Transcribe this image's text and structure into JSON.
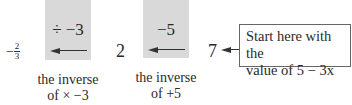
{
  "diagram": {
    "steps": [
      {
        "operation": "÷ −3",
        "inverse_label_line1": "the inverse",
        "inverse_label_line2": "of × −3"
      },
      {
        "operation": "−5",
        "inverse_label_line1": "the inverse",
        "inverse_label_line2": "of +5"
      }
    ],
    "values": {
      "result_sign": "−",
      "result_numerator": "2",
      "result_denominator": "3",
      "middle": "2",
      "start": "7"
    },
    "callout": {
      "line1": "Start here with the",
      "line2": "value of 5 − 3x"
    },
    "colors": {
      "box_fill": "#d9d9d9",
      "arrow": "#333333",
      "text": "#2a2a2a"
    }
  }
}
